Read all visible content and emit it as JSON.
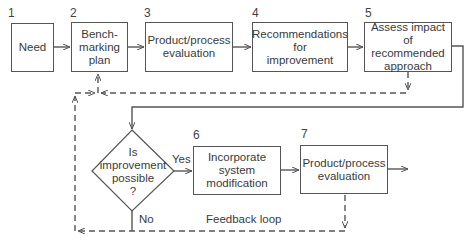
{
  "diagram": {
    "type": "flowchart",
    "steps": [
      {
        "number": "1",
        "label": "Need"
      },
      {
        "number": "2",
        "label": "Bench-\nmarking\nplan"
      },
      {
        "number": "3",
        "label": "Product/process\nevaluation"
      },
      {
        "number": "4",
        "label": "Recommendations\nfor\nimprovement"
      },
      {
        "number": "5",
        "label": "Assess impact of\nrecommended\napproach"
      },
      {
        "number": "6",
        "label": "Incorporate\nsystem\nmodification"
      },
      {
        "number": "7",
        "label": "Product/process\nevaluation"
      }
    ],
    "decision": {
      "label": "Is\nimprovement\npossible\n?",
      "yes_label": "Yes",
      "no_label": "No"
    },
    "feedback_label": "Feedback loop",
    "colors": {
      "line": "#555555",
      "text": "#3a3a3a",
      "background": "#ffffff"
    }
  }
}
